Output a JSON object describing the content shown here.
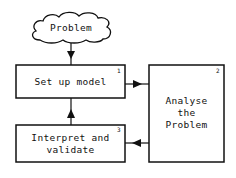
{
  "diagram": {
    "start": {
      "label": "Problem"
    },
    "nodes": [
      {
        "id": 1,
        "number": "1",
        "label": "Set up model"
      },
      {
        "id": 2,
        "number": "2",
        "label_lines": [
          "Analyse",
          "the",
          "Problem"
        ]
      },
      {
        "id": 3,
        "number": "3",
        "label_lines": [
          "Interpret and",
          "validate"
        ]
      }
    ],
    "edges": [
      {
        "from": "Problem",
        "to": 1
      },
      {
        "from": 1,
        "to": 2
      },
      {
        "from": 2,
        "to": 3
      },
      {
        "from": 3,
        "to": 1
      }
    ]
  }
}
